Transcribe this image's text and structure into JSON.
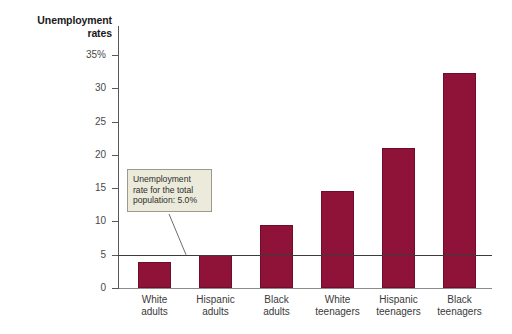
{
  "chart_data": {
    "type": "bar",
    "title": "Unemployment rates",
    "title_line1": "Unemployment",
    "title_line2": "rates",
    "xlabel": "",
    "ylabel": "Unemployment rates",
    "ylim": [
      0,
      35
    ],
    "grid": false,
    "legend": "none",
    "bar_color": "#8f1239",
    "categories": [
      "White adults",
      "Hispanic adults",
      "Black adults",
      "White teenagers",
      "Hispanic teenagers",
      "Black teenagers"
    ],
    "category_lines": [
      [
        "White",
        "adults"
      ],
      [
        "Hispanic",
        "adults"
      ],
      [
        "Black",
        "adults"
      ],
      [
        "White",
        "teenagers"
      ],
      [
        "Hispanic",
        "teenagers"
      ],
      [
        "Black",
        "teenagers"
      ]
    ],
    "values": [
      3.9,
      4.9,
      9.5,
      14.6,
      21.0,
      32.3
    ],
    "ytick_values": [
      0,
      5,
      10,
      15,
      20,
      25,
      30,
      35
    ],
    "ytick_labels": [
      "0",
      "5",
      "10",
      "15",
      "20",
      "25",
      "30",
      "35%"
    ],
    "reference_line": {
      "value": 5.0,
      "label": "Unemployment rate for the total population: 5.0%",
      "color": "#3c3c3e"
    },
    "annotations": [
      {
        "text": "Unemployment rate for the total population: 5.0%",
        "line1": "Unemployment",
        "line2": "rate for the total",
        "line3": "population: 5.0%",
        "points_to": "reference-line"
      }
    ]
  }
}
